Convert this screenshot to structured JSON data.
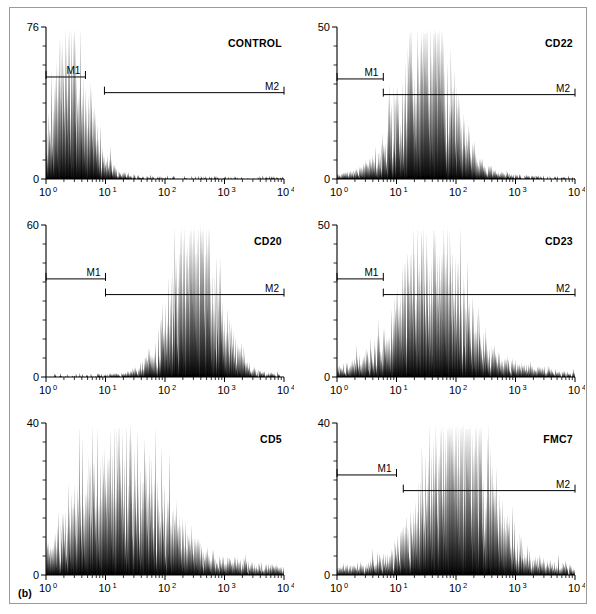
{
  "figure": {
    "caption": "(b)",
    "border_color": "#9a9a9a",
    "ink_color": "#000000"
  },
  "chart_data": [
    {
      "type": "area",
      "id": "control",
      "title": "CONTROL",
      "xlabel": "",
      "ylabel": "",
      "xscale": "log",
      "xlim": [
        1,
        10000
      ],
      "xticks": [
        "10",
        "10",
        "10",
        "10",
        "10"
      ],
      "xtick_exponents": [
        "0",
        "1",
        "2",
        "3",
        "4"
      ],
      "ylim": [
        0,
        76
      ],
      "ymax_label": "76",
      "ymin_label": "0",
      "y_minor_ticks": 8,
      "markers": [
        {
          "name": "M1",
          "start": 1.0,
          "end": 4.6,
          "level": 0.255
        },
        {
          "name": "M2",
          "start": 9.6,
          "end": 10000,
          "level": 0.335
        }
      ],
      "peak_decades": 0.4,
      "peak_fraction": 0.8,
      "width_decades": 0.32,
      "tail_fraction": 0.035,
      "seed": 11
    },
    {
      "type": "area",
      "id": "cd22",
      "title": "CD22",
      "xlabel": "",
      "ylabel": "",
      "xscale": "log",
      "xlim": [
        1,
        10000
      ],
      "xticks": [
        "10",
        "10",
        "10",
        "10",
        "10"
      ],
      "xtick_exponents": [
        "0",
        "1",
        "2",
        "3",
        "4"
      ],
      "ylim": [
        0,
        50
      ],
      "ymax_label": "50",
      "ymin_label": "0",
      "y_minor_ticks": 8,
      "markers": [
        {
          "name": "M1",
          "start": 1.0,
          "end": 6.0,
          "level": 0.265
        },
        {
          "name": "M2",
          "start": 6.0,
          "end": 10000,
          "level": 0.345
        }
      ],
      "peak_decades": 1.5,
      "peak_fraction": 0.94,
      "width_decades": 0.42,
      "tail_fraction": 0.05,
      "seed": 23
    },
    {
      "type": "area",
      "id": "cd20",
      "title": "CD20",
      "xlabel": "",
      "ylabel": "",
      "xscale": "log",
      "xlim": [
        1,
        10000
      ],
      "xticks": [
        "10",
        "10",
        "10",
        "10",
        "10"
      ],
      "xtick_exponents": [
        "0",
        "1",
        "2",
        "3",
        "4"
      ],
      "ylim": [
        0,
        60
      ],
      "ymax_label": "60",
      "ymin_label": "0",
      "y_minor_ticks": 8,
      "markers": [
        {
          "name": "M1",
          "start": 1.0,
          "end": 10.0,
          "level": 0.275
        },
        {
          "name": "M2",
          "start": 10.0,
          "end": 10000,
          "level": 0.355
        }
      ],
      "peak_decades": 2.5,
      "peak_fraction": 0.9,
      "width_decades": 0.38,
      "tail_fraction": 0.035,
      "seed": 20
    },
    {
      "type": "area",
      "id": "cd23",
      "title": "CD23",
      "xlabel": "",
      "ylabel": "",
      "xscale": "log",
      "xlim": [
        1,
        10000
      ],
      "xticks": [
        "10",
        "10",
        "10",
        "10",
        "10"
      ],
      "xtick_exponents": [
        "0",
        "1",
        "2",
        "3",
        "4"
      ],
      "ylim": [
        0,
        50
      ],
      "ymax_label": "50",
      "ymin_label": "0",
      "y_minor_ticks": 8,
      "markers": [
        {
          "name": "M1",
          "start": 1.0,
          "end": 6.0,
          "level": 0.275
        },
        {
          "name": "M2",
          "start": 6.0,
          "end": 10000,
          "level": 0.355
        }
      ],
      "peak_decades": 1.6,
      "peak_fraction": 0.72,
      "width_decades": 0.52,
      "tail_fraction": 0.09,
      "seed": 233
    },
    {
      "type": "area",
      "id": "cd5",
      "title": "CD5",
      "xlabel": "",
      "ylabel": "",
      "xscale": "log",
      "xlim": [
        1,
        10000
      ],
      "xticks": [
        "10",
        "10",
        "10",
        "10",
        "10"
      ],
      "xtick_exponents": [
        "0",
        "1",
        "2",
        "3",
        "4"
      ],
      "ylim": [
        0,
        40
      ],
      "ymax_label": "40",
      "ymin_label": "0",
      "y_minor_ticks": 8,
      "markers": [],
      "peak_decades": 1.25,
      "peak_fraction": 0.7,
      "width_decades": 0.62,
      "tail_fraction": 0.13,
      "seed": 5
    },
    {
      "type": "area",
      "id": "fmc7",
      "title": "FMC7",
      "xlabel": "",
      "ylabel": "",
      "xscale": "log",
      "xlim": [
        1,
        10000
      ],
      "xticks": [
        "10",
        "10",
        "10",
        "10",
        "10"
      ],
      "xtick_exponents": [
        "0",
        "1",
        "2",
        "3",
        "4"
      ],
      "ylim": [
        0,
        40
      ],
      "ymax_label": "40",
      "ymin_label": "0",
      "y_minor_ticks": 8,
      "markers": [
        {
          "name": "M1",
          "start": 1.0,
          "end": 10.0,
          "level": 0.265
        },
        {
          "name": "M2",
          "start": 13.0,
          "end": 10000,
          "level": 0.345
        }
      ],
      "peak_decades": 2.05,
      "peak_fraction": 0.92,
      "width_decades": 0.5,
      "tail_fraction": 0.11,
      "seed": 77
    }
  ],
  "layout": {
    "panel_positions": [
      {
        "id": "control",
        "x": 0,
        "y": 0
      },
      {
        "id": "cd22",
        "x": 291,
        "y": 0
      },
      {
        "id": "cd20",
        "x": 0,
        "y": 198
      },
      {
        "id": "cd23",
        "x": 291,
        "y": 198
      },
      {
        "id": "cd5",
        "x": 0,
        "y": 396
      },
      {
        "id": "fmc7",
        "x": 291,
        "y": 396
      }
    ]
  }
}
